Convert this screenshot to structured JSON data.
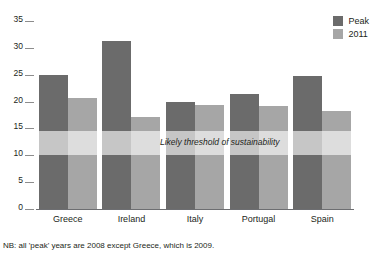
{
  "chart_data": {
    "type": "bar",
    "title": "",
    "subtitle": "",
    "xlabel": "",
    "ylabel": "",
    "ylim": [
      0,
      35
    ],
    "yticks": [
      0,
      5,
      10,
      15,
      20,
      25,
      30,
      35
    ],
    "ytick_labels": [
      "0",
      "5",
      "10",
      "15",
      "20",
      "25",
      "30",
      "35"
    ],
    "grid": false,
    "legend_position": "top-right",
    "categories": [
      "Greece",
      "Ireland",
      "Italy",
      "Portugal",
      "Spain"
    ],
    "series": [
      {
        "name": "Peak",
        "color": "#6b6b6b",
        "values": [
          25.0,
          31.3,
          20.0,
          21.4,
          24.7
        ]
      },
      {
        "name": "2011",
        "color": "#a6a6a6",
        "values": [
          20.6,
          17.2,
          19.3,
          19.2,
          18.3
        ]
      }
    ],
    "annotations": [
      {
        "text": "Likely threshold of sustainability",
        "type": "band",
        "y_from": 10.0,
        "y_to": 14.5
      }
    ],
    "footnote": "NB: all 'peak' years are 2008 except Greece, which is 2009."
  },
  "legend": {
    "items": [
      {
        "label": "Peak",
        "color": "#6b6b6b"
      },
      {
        "label": "2011",
        "color": "#a6a6a6"
      }
    ]
  },
  "colors": {
    "peak": "#6b6b6b",
    "y2011": "#a6a6a6",
    "axis": "#6d6e71",
    "text": "#231f20",
    "band": "rgba(255,255,255,0.62)"
  }
}
